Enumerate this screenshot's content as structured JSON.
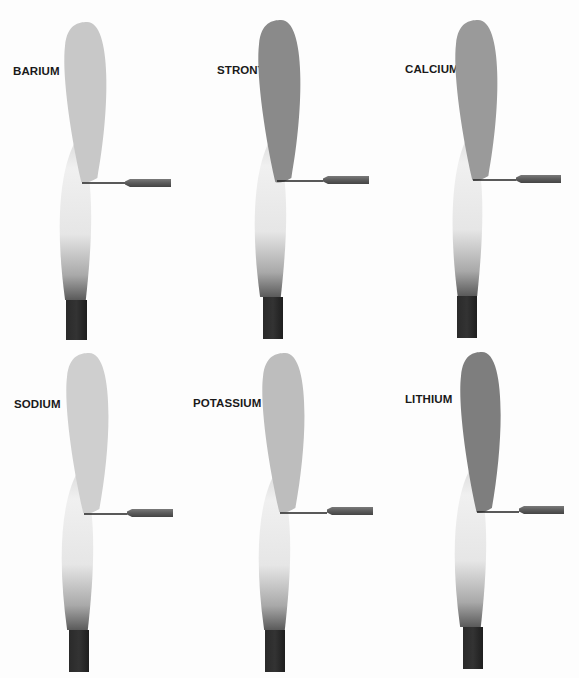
{
  "figure": {
    "panels": [
      {
        "element": "BARIUM",
        "flame_color": "#c8c8c8",
        "panel_x": 0,
        "panel_y": 0,
        "label_x": 13,
        "label_y": 65,
        "flame": {
          "cx": 87,
          "top": 22,
          "bottom": 182,
          "rx": 23
        },
        "base": {
          "cx": 75,
          "top": 135,
          "bottom": 300,
          "rx": 18
        },
        "burner": {
          "x": 66,
          "y": 300,
          "w": 21,
          "h": 40
        },
        "wire": {
          "x1": 82,
          "y": 183,
          "x2": 125
        },
        "handle": {
          "x": 125,
          "y": 179,
          "w": 46,
          "h": 8
        }
      },
      {
        "element": "STRONTIUM",
        "flame_color": "#8a8a8a",
        "panel_x": 0,
        "panel_y": 0,
        "label_x": 217,
        "label_y": 64,
        "flame": {
          "cx": 281,
          "top": 20,
          "bottom": 182,
          "rx": 23
        },
        "base": {
          "cx": 270,
          "top": 133,
          "bottom": 297,
          "rx": 18
        },
        "burner": {
          "x": 263,
          "y": 297,
          "w": 20,
          "h": 42
        },
        "wire": {
          "x1": 277,
          "y": 181,
          "x2": 323
        },
        "handle": {
          "x": 323,
          "y": 176,
          "w": 46,
          "h": 8
        }
      },
      {
        "element": "CALCIUM",
        "flame_color": "#9a9a9a",
        "panel_x": 0,
        "panel_y": 0,
        "label_x": 405,
        "label_y": 63,
        "flame": {
          "cx": 478,
          "top": 20,
          "bottom": 180,
          "rx": 23
        },
        "base": {
          "cx": 467,
          "top": 130,
          "bottom": 296,
          "rx": 17
        },
        "burner": {
          "x": 457,
          "y": 296,
          "w": 20,
          "h": 42
        },
        "wire": {
          "x1": 473,
          "y": 180,
          "x2": 516
        },
        "handle": {
          "x": 516,
          "y": 175,
          "w": 45,
          "h": 8
        }
      },
      {
        "element": "SODIUM",
        "flame_color": "#cfcfcf",
        "panel_x": 0,
        "panel_y": 0,
        "label_x": 14,
        "label_y": 398,
        "flame": {
          "cx": 89,
          "top": 353,
          "bottom": 513,
          "rx": 23
        },
        "base": {
          "cx": 77,
          "top": 466,
          "bottom": 630,
          "rx": 18
        },
        "burner": {
          "x": 69,
          "y": 630,
          "w": 20,
          "h": 42
        },
        "wire": {
          "x1": 84,
          "y": 514,
          "x2": 127
        },
        "handle": {
          "x": 127,
          "y": 509,
          "w": 46,
          "h": 8
        }
      },
      {
        "element": "POTASSIUM",
        "flame_color": "#bdbdbd",
        "panel_x": 0,
        "panel_y": 0,
        "label_x": 193,
        "label_y": 397,
        "flame": {
          "cx": 285,
          "top": 353,
          "bottom": 512,
          "rx": 23
        },
        "base": {
          "cx": 274,
          "top": 468,
          "bottom": 630,
          "rx": 18
        },
        "burner": {
          "x": 265,
          "y": 630,
          "w": 20,
          "h": 42
        },
        "wire": {
          "x1": 280,
          "y": 513,
          "x2": 327
        },
        "handle": {
          "x": 327,
          "y": 507,
          "w": 46,
          "h": 8
        }
      },
      {
        "element": "LITHIUM",
        "flame_color": "#7e7e7e",
        "panel_x": 0,
        "panel_y": 0,
        "label_x": 405,
        "label_y": 393,
        "flame": {
          "cx": 482,
          "top": 352,
          "bottom": 512,
          "rx": 22
        },
        "base": {
          "cx": 470,
          "top": 462,
          "bottom": 627,
          "rx": 18
        },
        "burner": {
          "x": 463,
          "y": 627,
          "w": 20,
          "h": 42
        },
        "wire": {
          "x1": 477,
          "y": 512,
          "x2": 519
        },
        "handle": {
          "x": 519,
          "y": 506,
          "w": 45,
          "h": 8
        }
      }
    ]
  },
  "labels": {
    "barium": "BARIUM",
    "strontium": "STRONTIUM",
    "calcium": "CALCIUM",
    "sodium": "SODIUM",
    "potassium": "POTASSIUM",
    "lithium": "LITHIUM"
  }
}
